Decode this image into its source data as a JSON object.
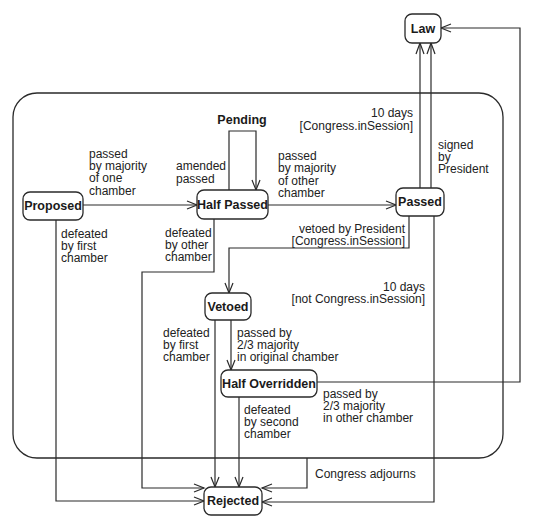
{
  "diagram": {
    "type": "UML state machine",
    "composite_state": {
      "name": ""
    },
    "states": {
      "law": "Law",
      "pending": "Pending",
      "proposed": "Proposed",
      "half_passed": "Half Passed",
      "passed": "Passed",
      "vetoed": "Vetoed",
      "half_overridden": "Half Overridden",
      "rejected": "Rejected"
    },
    "transitions": {
      "proposed_to_half_passed": [
        "passed",
        "by majority",
        "of one",
        "chamber"
      ],
      "pending_self_loop": [
        "amended",
        "passed"
      ],
      "half_passed_to_passed": [
        "passed",
        "by majority",
        "of other",
        "chamber"
      ],
      "passed_to_law_10days": [
        "10 days",
        "[Congress.inSession]"
      ],
      "passed_to_law_signed": [
        "signed",
        "by",
        "President"
      ],
      "passed_to_vetoed": [
        "vetoed by President",
        "[Congress.inSession]"
      ],
      "passed_to_rejected_pocket": [
        "10 days",
        "[not Congress.inSession]"
      ],
      "proposed_to_rejected": [
        "defeated",
        "by first",
        "chamber"
      ],
      "half_passed_to_rejected": [
        "defeated",
        "by other",
        "chamber"
      ],
      "vetoed_to_rejected": [
        "defeated",
        "by first",
        "chamber"
      ],
      "vetoed_to_half_overridden": [
        "passed by",
        "2/3 majority",
        "in original chamber"
      ],
      "half_overridden_to_rejected": [
        "defeated",
        "by second",
        "chamber"
      ],
      "half_overridden_to_law": [
        "passed by",
        "2/3 majority",
        "in other chamber"
      ],
      "composite_to_rejected": [
        "Congress adjourns"
      ]
    }
  }
}
